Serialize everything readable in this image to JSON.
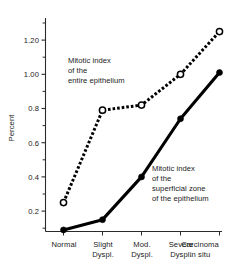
{
  "chart_data": {
    "type": "line",
    "title": "",
    "xlabel": "",
    "ylabel": "Percent",
    "categories": [
      "Normal",
      "Slight Dyspl.",
      "Mod. Dyspl.",
      "Severe Dyspl.",
      "Carcinoma in situ"
    ],
    "category_lines": [
      [
        "Normal"
      ],
      [
        "Slight",
        "Dyspl."
      ],
      [
        "Mod.",
        "Dyspl."
      ],
      [
        "Severe",
        "Dyspl."
      ],
      [
        "Carcinoma",
        "in situ"
      ]
    ],
    "ylim": [
      0.05,
      1.3
    ],
    "y_major_ticks": [
      0.2,
      0.4,
      0.6,
      0.8,
      1.0,
      1.2
    ],
    "y_major_tick_labels": [
      "0.2",
      "0.4",
      "0.6",
      "0.8",
      "1.00",
      "1.20"
    ],
    "y_minor_ticks": [
      0.1,
      0.3,
      0.5,
      0.7,
      0.9,
      1.1,
      1.3
    ],
    "grid": false,
    "legend_position": "annotations-inline",
    "series": [
      {
        "name": "Mitotic index of the entire epithelium",
        "style": "dashed",
        "marker": "open-circle",
        "values": [
          0.25,
          0.79,
          0.82,
          1.0,
          1.25
        ]
      },
      {
        "name": "Mitotic index of the superficial zone of the epithelium",
        "style": "solid",
        "marker": "filled-circle",
        "values": [
          0.09,
          0.15,
          0.4,
          0.74,
          1.01
        ]
      }
    ],
    "annotations": [
      {
        "id": "annotation-entire-epithelium",
        "lines": [
          "Mitotic index",
          "of the",
          "entire epithelium"
        ],
        "x": 68,
        "y": 57
      },
      {
        "id": "annotation-superficial-zone",
        "lines": [
          "Mitotic index",
          "of the",
          "superficial zone",
          "of the epithelium"
        ],
        "x": 156,
        "y": 165
      }
    ],
    "colors": {
      "series_line": "#000000",
      "axis": "#2a2a2a",
      "text": "#1a1a1a",
      "background": "#ffffff",
      "marker_open_fill": "#ffffff"
    }
  }
}
